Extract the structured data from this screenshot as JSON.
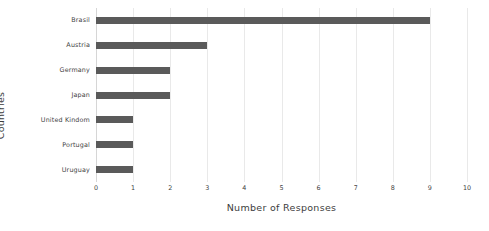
{
  "chart_data": {
    "type": "bar",
    "orientation": "horizontal",
    "title": "",
    "xlabel": "Number of Responses",
    "ylabel": "Countries",
    "categories": [
      "Brasil",
      "Austria",
      "Germany",
      "Japan",
      "United Kindom",
      "Portugal",
      "Uruguay"
    ],
    "values": [
      9,
      3,
      2,
      2,
      1,
      1,
      1
    ],
    "xlim": [
      0,
      10
    ],
    "xticks": [
      "0",
      "1",
      "2",
      "3",
      "4",
      "5",
      "6",
      "7",
      "8",
      "9",
      "10"
    ],
    "grid": "vertical",
    "legend": "none",
    "bar_color": "#5a5a5a",
    "grid_color": "#e9e9e9",
    "background_color": "#ffffff"
  }
}
